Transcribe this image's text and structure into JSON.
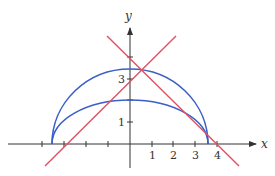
{
  "diagram": {
    "axes": {
      "x_label": "x",
      "y_label": "y",
      "x_tick_labels": [
        "1",
        "2",
        "3",
        "4"
      ],
      "y_tick_labels": [
        "1",
        "3"
      ],
      "axis_color": "#333333"
    },
    "curves": [
      {
        "name": "outer-semi-ellipse",
        "color": "#3a5fc8",
        "x_range": [
          -3.6,
          3.6
        ],
        "height": 3.4
      },
      {
        "name": "inner-semi-ellipse",
        "color": "#3a5fc8",
        "x_range": [
          -3.6,
          3.6
        ],
        "height": 2.0
      }
    ],
    "lines": [
      {
        "name": "rising-line",
        "color": "#e05060",
        "equation": "y = x + 3"
      },
      {
        "name": "falling-line",
        "color": "#e05060",
        "equation": "y = -x + 4"
      }
    ]
  }
}
